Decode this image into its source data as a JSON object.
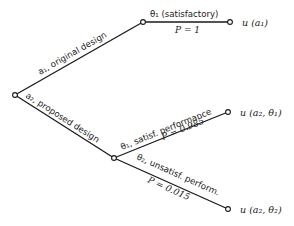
{
  "diagram": {
    "type": "decision-tree",
    "nodes": {
      "root": {
        "x": 15,
        "y": 95
      },
      "a1_end": {
        "x": 143,
        "y": 22
      },
      "a1_outcome": {
        "x": 230,
        "y": 22
      },
      "a2_chance": {
        "x": 114,
        "y": 158
      },
      "a2_theta1": {
        "x": 228,
        "y": 112
      },
      "a2_theta2": {
        "x": 228,
        "y": 209
      }
    },
    "branches": {
      "a1": {
        "label": "a₁, original design"
      },
      "a2": {
        "label": "a₂, proposed design"
      },
      "a1_theta1": {
        "label": "θ₁ (satisfactory)",
        "prob": "P = 1"
      },
      "a2_theta1": {
        "label": "θ₁, satisf. performance",
        "prob": "P = 0.985"
      },
      "a2_theta2": {
        "label": "θ₂, unsatisf. perform.",
        "prob": "P = 0.015"
      }
    },
    "payoffs": {
      "a1": "u (a₁)",
      "a2_theta1": "u (a₂, θ₁)",
      "a2_theta2": "u (a₂, θ₂)"
    }
  }
}
